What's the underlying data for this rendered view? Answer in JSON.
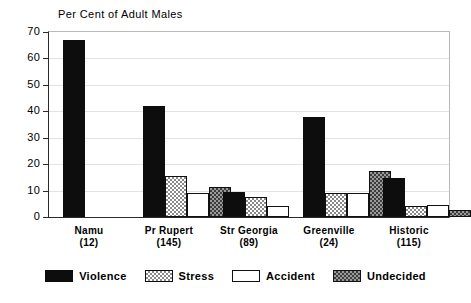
{
  "chart_data": {
    "type": "bar",
    "title": "Per Cent of Adult Males",
    "xlabel": "",
    "ylabel": "",
    "ylim": [
      0,
      70
    ],
    "yticks": [
      0,
      10,
      20,
      30,
      40,
      50,
      60,
      70
    ],
    "grid": true,
    "legend_position": "bottom",
    "categories": [
      "Namu",
      "Pr Rupert",
      "Str Georgia",
      "Greenville",
      "Historic"
    ],
    "category_counts": [
      "(12)",
      "(145)",
      "(89)",
      "(24)",
      "(115)"
    ],
    "series": [
      {
        "name": "Violence",
        "pattern": "solid-black",
        "values": [
          67,
          42,
          9.5,
          38,
          14.8
        ]
      },
      {
        "name": "Stress",
        "pattern": "light-checker",
        "values": [
          0,
          15.5,
          7.5,
          9,
          4.3
        ]
      },
      {
        "name": "Accident",
        "pattern": "white-outline",
        "values": [
          0,
          9,
          4,
          9,
          4.5
        ]
      },
      {
        "name": "Undecided",
        "pattern": "dark-checker",
        "values": [
          0,
          11.5,
          0,
          17.5,
          2.7
        ]
      }
    ]
  },
  "legend": {
    "items": [
      {
        "label": "Violence"
      },
      {
        "label": "Stress"
      },
      {
        "label": "Accident"
      },
      {
        "label": "Undecided"
      }
    ]
  }
}
